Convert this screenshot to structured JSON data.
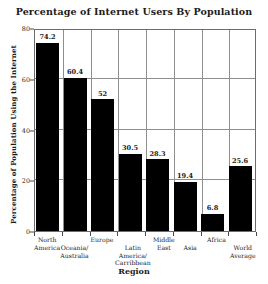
{
  "chart_data": {
    "type": "bar",
    "title": "Percentage of Internet Users By Population",
    "xlabel": "Region",
    "ylabel": "Percentage of Population Using the Internet",
    "ylim": [
      0,
      80
    ],
    "yticks": [
      0,
      20,
      40,
      60,
      80
    ],
    "ytick_labels": [
      "0",
      "20",
      "40",
      "60",
      "80"
    ],
    "grid": true,
    "legend": null,
    "bar_color": "#000000",
    "categories": [
      "North America",
      "Oceania/ Australia",
      "Europe",
      "Latin America/ Carribbean",
      "Middle East",
      "Asia",
      "Africa",
      "World Average"
    ],
    "category_lines": [
      [
        "North",
        "America"
      ],
      [
        "Oceania/",
        "Australia"
      ],
      [
        "Europe"
      ],
      [
        "Latin",
        "America/",
        "Carribbean"
      ],
      [
        "Middle",
        "East"
      ],
      [
        "Asia"
      ],
      [
        "Africa"
      ],
      [
        "World",
        "Average"
      ]
    ],
    "category_label_offsets": [
      0,
      8,
      0,
      8,
      0,
      8,
      0,
      8
    ],
    "values": [
      74.2,
      60.4,
      52,
      30.5,
      28.3,
      19.4,
      6.8,
      25.6
    ],
    "value_labels": [
      "74.2",
      "60.4",
      "52",
      "30.5",
      "28.3",
      "19.4",
      "6.8",
      "25.6"
    ]
  }
}
